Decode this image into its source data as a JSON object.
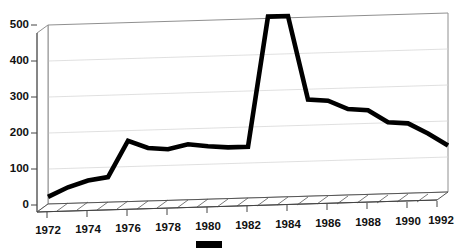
{
  "chart_data": {
    "type": "line",
    "title": "",
    "subtitle": "",
    "xlabel": "",
    "ylabel": "",
    "style": "3d-area-floor",
    "grid": true,
    "legend_position": "bottom-center",
    "xlim": [
      1972,
      1992
    ],
    "ylim": [
      0,
      500
    ],
    "yticks": [
      0,
      100,
      200,
      300,
      400,
      500
    ],
    "ytick_labels": [
      "0",
      "100",
      "200",
      "300",
      "400",
      "500"
    ],
    "xticks": [
      1972,
      1974,
      1976,
      1978,
      1980,
      1982,
      1984,
      1986,
      1988,
      1990,
      1992
    ],
    "xtick_labels": [
      "1972",
      "1974",
      "1976",
      "1978",
      "1980",
      "1982",
      "1984",
      "1986",
      "1988",
      "1990",
      "1992"
    ],
    "x": [
      1972,
      1973,
      1974,
      1975,
      1976,
      1977,
      1978,
      1979,
      1980,
      1981,
      1982,
      1983,
      1984,
      1985,
      1986,
      1987,
      1988,
      1989,
      1990,
      1991,
      1992
    ],
    "series": [
      {
        "name": "Series 1",
        "color": "#000000",
        "values": [
          20,
          45,
          62,
          70,
          170,
          148,
          143,
          155,
          148,
          143,
          143,
          505,
          505,
          270,
          265,
          240,
          235,
          200,
          195,
          165,
          130
        ]
      }
    ],
    "legend": [
      {
        "label": "",
        "color": "#000000",
        "swatch": "filled-rect"
      }
    ]
  },
  "axes": {
    "y_axis_name": "value-axis",
    "x_axis_name": "year-axis"
  }
}
